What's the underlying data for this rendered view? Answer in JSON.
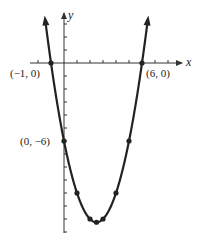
{
  "chart_data": {
    "type": "line",
    "title": "",
    "function": "y = (x + 1)(x - 6) = x^2 - 5x - 6",
    "xlabel": "x",
    "ylabel": "y",
    "xlim": [
      -2.6,
      9.0
    ],
    "ylim": [
      -13.0,
      3.9
    ],
    "grid": false,
    "legend": null,
    "x_ticks": [
      -2,
      -1,
      1,
      2,
      3,
      4,
      5,
      6,
      7,
      8
    ],
    "y_ticks": [
      3,
      2,
      1,
      -1,
      -2,
      -3,
      -4,
      -5,
      -6,
      -7,
      -8,
      -9,
      -10,
      -11,
      -12,
      -13
    ],
    "curve_domain": [
      -1.45,
      6.45
    ],
    "curve_arrows": "both ends point upward",
    "points": [
      {
        "x": -1,
        "y": 0,
        "label": "(−1, 0)"
      },
      {
        "x": 6,
        "y": 0,
        "label": "(6, 0)"
      },
      {
        "x": 0,
        "y": -6,
        "label": "(0, −6)"
      },
      {
        "x": 5,
        "y": -6,
        "label": ""
      },
      {
        "x": 1,
        "y": -10,
        "label": ""
      },
      {
        "x": 4,
        "y": -10,
        "label": ""
      },
      {
        "x": 2,
        "y": -12,
        "label": ""
      },
      {
        "x": 3,
        "y": -12,
        "label": ""
      },
      {
        "x": 2.5,
        "y": -12.25,
        "label": ""
      }
    ],
    "colors": {
      "curve": "#222222",
      "axes": "#333333",
      "background": "#ffffff"
    }
  },
  "labels": {
    "x_axis": "x",
    "y_axis": "y",
    "pt_neg1_0": "(−1, 0)",
    "pt_6_0": "(6, 0)",
    "pt_0_neg6": "(0, −6)"
  }
}
